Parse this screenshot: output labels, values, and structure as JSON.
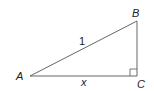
{
  "diagram": {
    "type": "right-triangle",
    "vertices": {
      "A": {
        "label": "A"
      },
      "B": {
        "label": "B"
      },
      "C": {
        "label": "C"
      }
    },
    "sides": {
      "hypotenuse_AB": {
        "label": "1"
      },
      "base_AC": {
        "label": "x"
      }
    },
    "right_angle_at": "C",
    "colors": {
      "stroke": "#555555",
      "text": "#222222"
    }
  }
}
